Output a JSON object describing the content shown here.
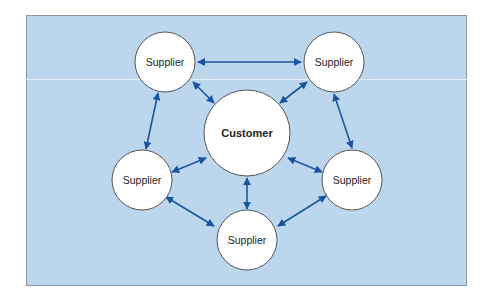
{
  "diagram": {
    "type": "network",
    "background_color": "#bcd6ee",
    "arrow_color": "#1a56a0",
    "center": {
      "id": "customer",
      "label": "Customer",
      "bold": true
    },
    "nodes": [
      {
        "id": "supplier-top-left",
        "label": "Supplier"
      },
      {
        "id": "supplier-top-right",
        "label": "Supplier"
      },
      {
        "id": "supplier-left",
        "label": "Supplier"
      },
      {
        "id": "supplier-right",
        "label": "Supplier"
      },
      {
        "id": "supplier-bottom",
        "label": "Supplier"
      }
    ],
    "edges": [
      {
        "from": "supplier-top-left",
        "to": "supplier-top-right",
        "bidirectional": true
      },
      {
        "from": "supplier-top-right",
        "to": "supplier-right",
        "bidirectional": true
      },
      {
        "from": "supplier-right",
        "to": "supplier-bottom",
        "bidirectional": true
      },
      {
        "from": "supplier-bottom",
        "to": "supplier-left",
        "bidirectional": true
      },
      {
        "from": "supplier-left",
        "to": "supplier-top-left",
        "bidirectional": true
      },
      {
        "from": "customer",
        "to": "supplier-top-left",
        "bidirectional": true
      },
      {
        "from": "customer",
        "to": "supplier-top-right",
        "bidirectional": true
      },
      {
        "from": "customer",
        "to": "supplier-left",
        "bidirectional": true
      },
      {
        "from": "customer",
        "to": "supplier-right",
        "bidirectional": true
      },
      {
        "from": "customer",
        "to": "supplier-bottom",
        "bidirectional": true
      }
    ]
  }
}
